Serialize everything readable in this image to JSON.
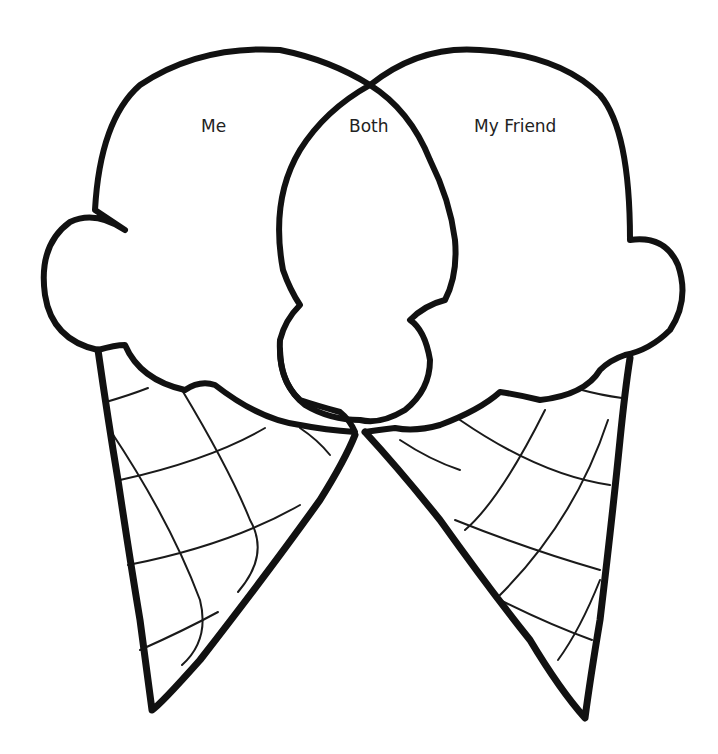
{
  "diagram": {
    "type": "venn-ice-cream-cones",
    "labels": {
      "left": "Me",
      "center": "Both",
      "right": "My Friend"
    },
    "colors": {
      "line": "#111111",
      "background": "#ffffff",
      "text": "#222222"
    }
  }
}
